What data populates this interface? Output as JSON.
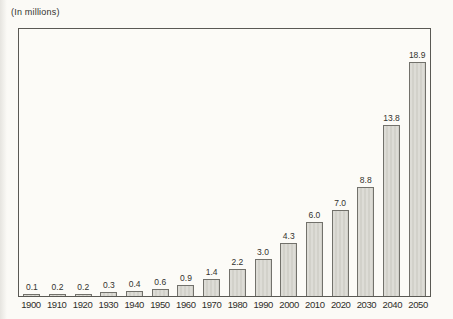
{
  "chart_data": {
    "type": "bar",
    "title": "(In millions)",
    "categories": [
      "1900",
      "1910",
      "1920",
      "1930",
      "1940",
      "1950",
      "1960",
      "1970",
      "1980",
      "1990",
      "2000",
      "2010",
      "2020",
      "2030",
      "2040",
      "2050"
    ],
    "values": [
      0.1,
      0.2,
      0.2,
      0.3,
      0.4,
      0.6,
      0.9,
      1.4,
      2.2,
      3.0,
      4.3,
      6.0,
      7.0,
      8.8,
      13.8,
      18.9
    ],
    "value_labels": [
      "0.1",
      "0.2",
      "0.2",
      "0.3",
      "0.4",
      "0.6",
      "0.9",
      "1.4",
      "2.2",
      "3.0",
      "4.3",
      "6.0",
      "7.0",
      "8.8",
      "13.8",
      "18.9"
    ],
    "xlabel": "",
    "ylabel": "(In millions)",
    "ylim": [
      0,
      21.6
    ],
    "grid": false,
    "legend": null,
    "data_labels": true,
    "colors": {
      "bar_fill": "#d9d8d1",
      "bar_border": "#72716b",
      "frame_border": "#5a5954",
      "background": "#fbfaf6",
      "label_text": "#33322e"
    }
  }
}
